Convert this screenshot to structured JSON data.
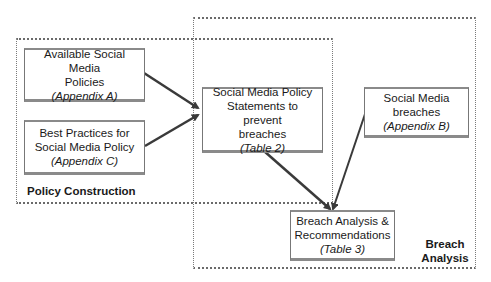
{
  "regions": {
    "policy_construction": {
      "label": "Policy Construction"
    },
    "breach_analysis": {
      "label_line1": "Breach",
      "label_line2": "Analysis"
    }
  },
  "nodes": {
    "available_policies": {
      "line1": "Available Social Media",
      "line2": "Policies",
      "ref": "(Appendix A)"
    },
    "best_practices": {
      "line1": "Best Practices for",
      "line2": "Social Media Policy",
      "ref": "(Appendix C)"
    },
    "policy_statements": {
      "line1": "Social Media Policy",
      "line2": "Statements to prevent",
      "line3": "breaches",
      "ref": "(Table 2)"
    },
    "social_media_breaches": {
      "line1": "Social Media",
      "line2": "breaches",
      "ref": "(Appendix B)"
    },
    "breach_analysis": {
      "line1": "Breach Analysis &",
      "line2": "Recommendations",
      "ref": "(Table 3)"
    }
  },
  "edges": [
    {
      "from": "available_policies",
      "to": "policy_statements"
    },
    {
      "from": "best_practices",
      "to": "policy_statements"
    },
    {
      "from": "policy_statements",
      "to": "breach_analysis"
    },
    {
      "from": "social_media_breaches",
      "to": "breach_analysis"
    }
  ],
  "colors": {
    "arrow": "#3a3a3a",
    "border": "#777777"
  }
}
